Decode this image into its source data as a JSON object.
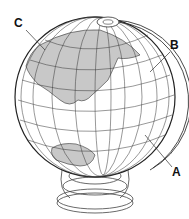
{
  "figure": {
    "labels": {
      "a": "A",
      "b": "B",
      "c": "C"
    },
    "colors": {
      "land": "#c8c8c8",
      "lines": "#333333",
      "ocean": "#ffffff"
    }
  }
}
